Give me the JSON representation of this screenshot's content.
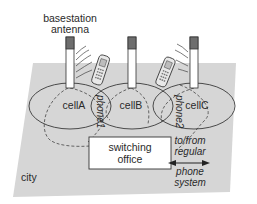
{
  "diagram": {
    "colors": {
      "plane": "#d6d6d6",
      "antenna_top": "#6e6e6e",
      "line": "#3a3a3a",
      "dashed": "#555555",
      "background": "#ffffff"
    },
    "labels": {
      "antenna_line1": "basestation",
      "antenna_line2": "antenna",
      "cellA": "cellA",
      "cellB": "cellB",
      "cellC": "cellC",
      "phone1": "phone1",
      "phone2": "phone2",
      "switching_line1": "switching",
      "switching_line2": "office",
      "external_line1": "to/from",
      "external_line2": "regular",
      "external_line3": "phone",
      "external_line4": "system",
      "city": "city"
    },
    "nodes": [
      {
        "id": "antennaA",
        "type": "basestation-antenna",
        "cell": "cellA"
      },
      {
        "id": "antennaB",
        "type": "basestation-antenna",
        "cell": "cellB"
      },
      {
        "id": "antennaC",
        "type": "basestation-antenna",
        "cell": "cellC"
      },
      {
        "id": "phone1",
        "type": "mobile-phone",
        "location": "between cellA and cellB"
      },
      {
        "id": "phone2",
        "type": "mobile-phone",
        "location": "between cellB and cellC"
      },
      {
        "id": "switching-office",
        "type": "switch"
      },
      {
        "id": "regular-phone-system",
        "type": "external"
      }
    ],
    "edges": [
      {
        "from": "antennaA",
        "to": "switching-office",
        "style": "dashed"
      },
      {
        "from": "antennaB",
        "to": "switching-office",
        "style": "dashed"
      },
      {
        "from": "antennaC",
        "to": "switching-office",
        "style": "dashed"
      },
      {
        "from": "switching-office",
        "to": "regular-phone-system",
        "style": "bidirectional-arrow"
      }
    ]
  }
}
